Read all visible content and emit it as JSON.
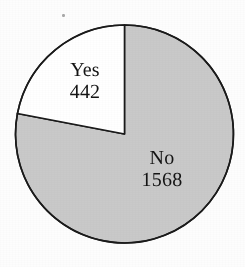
{
  "chart_data": {
    "type": "pie",
    "title": "",
    "subtitle": "",
    "xlabel": "",
    "ylabel": "",
    "legend_position": "none",
    "grid": false,
    "labels_inside": true,
    "total": 2010,
    "categories": [
      "Yes",
      "No"
    ],
    "values": [
      442,
      1568
    ],
    "percentages": [
      22.0,
      78.0
    ],
    "start_angle_deg": 0,
    "direction": "counterclockwise",
    "slices": [
      {
        "label": "Yes",
        "value": 442,
        "value_text": "442",
        "percent": 22.0,
        "sweep_deg": 79.2,
        "fill": "#ffffff",
        "stroke": "#1a1a1a"
      },
      {
        "label": "No",
        "value": 1568,
        "value_text": "1568",
        "percent": 78.0,
        "sweep_deg": 280.8,
        "fill": "#c9c9c9",
        "stroke": "#1a1a1a"
      }
    ],
    "geometry": {
      "center_x": 124.5,
      "center_y": 134,
      "radius": 109,
      "stroke_width": 1.6
    },
    "colors": {
      "background": "#fdfdfd",
      "outline": "#1a1a1a",
      "slice_yes": "#ffffff",
      "slice_no": "#c9c9c9",
      "label_text": "#141414"
    }
  }
}
